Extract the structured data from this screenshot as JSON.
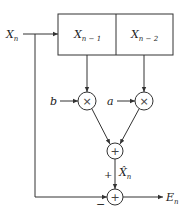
{
  "diagram": {
    "type": "block-diagram",
    "input": {
      "symbol": "X",
      "subscript": "n"
    },
    "delay_register": {
      "cells": [
        {
          "symbol": "X",
          "subscript": "n − 1"
        },
        {
          "symbol": "X",
          "subscript": "n − 2"
        }
      ]
    },
    "multipliers": [
      {
        "coefficient": "b",
        "operator": "×"
      },
      {
        "coefficient": "a",
        "operator": "×"
      }
    ],
    "adder": {
      "operator": "+"
    },
    "prediction": {
      "symbol": "X̂",
      "subscript": "n",
      "sign": "+"
    },
    "subtractor": {
      "operator": "+",
      "input_sign": "−"
    },
    "output": {
      "symbol": "E",
      "subscript": "n"
    }
  }
}
